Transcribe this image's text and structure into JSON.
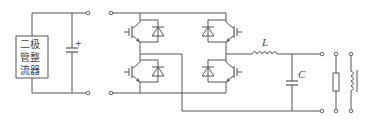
{
  "diagram": {
    "type": "circuit",
    "stroke_color": "#555555",
    "rectifier": {
      "label_line1": "二极",
      "label_line2": "管整",
      "label_line3": "流器"
    },
    "dc_capacitor": {
      "polarity_mark": "+"
    },
    "filter": {
      "inductor_label": "L",
      "capacitor_label": "C"
    },
    "load": {
      "elements": [
        "resistor",
        "inductor"
      ]
    }
  }
}
